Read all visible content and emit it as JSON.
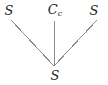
{
  "diagram": {
    "type": "chemical-structure",
    "width": 108,
    "height": 85,
    "background_color": "#ffffff",
    "bond_color": "#8a8a8a",
    "label_color": "#232323",
    "atoms": [
      {
        "id": "top-left",
        "label": "S",
        "subscript": "",
        "x": 9,
        "y": 10
      },
      {
        "id": "top-center",
        "label": "C",
        "subscript": "c",
        "x": 55,
        "y": 10
      },
      {
        "id": "top-right",
        "label": "S",
        "subscript": "",
        "x": 94,
        "y": 10
      },
      {
        "id": "bottom-center",
        "label": "S",
        "subscript": "",
        "x": 55,
        "y": 75
      }
    ],
    "bonds": [
      {
        "id": "bond-left",
        "from": "top-left",
        "to": "bottom-center",
        "x1": 11,
        "y1": 20,
        "x2": 54,
        "y2": 66
      },
      {
        "id": "bond-center",
        "from": "top-center",
        "to": "bottom-center",
        "x1": 54,
        "y1": 21,
        "x2": 54,
        "y2": 66
      },
      {
        "id": "bond-right",
        "from": "top-right",
        "to": "bottom-center",
        "x1": 97,
        "y1": 20,
        "x2": 54,
        "y2": 66
      }
    ]
  }
}
